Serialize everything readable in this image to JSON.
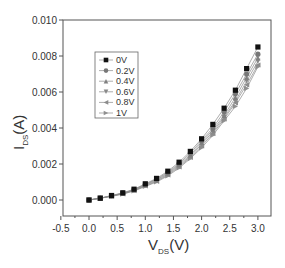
{
  "chart_data": {
    "type": "line",
    "title": "",
    "xlabel": "V_DS (V)",
    "ylabel": "I_DS (A)",
    "xlabel_main": "V",
    "xlabel_sub": "DS",
    "xlabel_unit": "(V)",
    "ylabel_main": "I",
    "ylabel_sub": "DS",
    "ylabel_unit": "(A)",
    "xlim": [
      -0.5,
      3.25
    ],
    "ylim": [
      -0.0009,
      0.01
    ],
    "x_ticks": [
      "-0.5",
      "0.0",
      "0.5",
      "1.0",
      "1.5",
      "2.0",
      "2.5",
      "3.0"
    ],
    "x_tick_values": [
      -0.5,
      0.0,
      0.5,
      1.0,
      1.5,
      2.0,
      2.5,
      3.0
    ],
    "y_ticks": [
      "0.000",
      "0.002",
      "0.004",
      "0.006",
      "0.008",
      "0.010"
    ],
    "y_tick_values": [
      0.0,
      0.002,
      0.004,
      0.006,
      0.008,
      0.01
    ],
    "grid": false,
    "legend_position": "upper-left-inside",
    "x": [
      0.0,
      0.2,
      0.4,
      0.6,
      0.8,
      1.0,
      1.2,
      1.4,
      1.6,
      1.8,
      2.0,
      2.2,
      2.4,
      2.6,
      2.8,
      3.0
    ],
    "series": [
      {
        "name": "0V",
        "marker": "square",
        "color": "#111111",
        "values": [
          0.0,
          0.0001,
          0.00025,
          0.0004,
          0.0006,
          0.0009,
          0.0012,
          0.0016,
          0.0021,
          0.0027,
          0.0034,
          0.0042,
          0.0051,
          0.0061,
          0.0073,
          0.0085
        ]
      },
      {
        "name": "0.2V",
        "marker": "circle",
        "color": "#777777",
        "values": [
          0.0,
          0.0001,
          0.00024,
          0.00038,
          0.00058,
          0.00087,
          0.00116,
          0.00154,
          0.00202,
          0.0026,
          0.0033,
          0.004,
          0.0049,
          0.0059,
          0.007,
          0.0081
        ]
      },
      {
        "name": "0.4V",
        "marker": "triangle-up",
        "color": "#808080",
        "values": [
          0.0,
          0.0001,
          0.00023,
          0.00037,
          0.00056,
          0.00084,
          0.00112,
          0.00149,
          0.00196,
          0.0025,
          0.0032,
          0.0039,
          0.0047,
          0.0057,
          0.0068,
          0.0079
        ]
      },
      {
        "name": "0.6V",
        "marker": "triangle-down",
        "color": "#888888",
        "values": [
          0.0,
          0.0001,
          0.00022,
          0.00036,
          0.00054,
          0.00081,
          0.00108,
          0.00144,
          0.0019,
          0.00243,
          0.0031,
          0.0038,
          0.0046,
          0.0055,
          0.0066,
          0.0077
        ]
      },
      {
        "name": "0.8V",
        "marker": "triangle-left",
        "color": "#8c8c8c",
        "values": [
          0.0,
          0.0001,
          0.00021,
          0.00034,
          0.00052,
          0.00078,
          0.00104,
          0.00139,
          0.00184,
          0.00236,
          0.003,
          0.0037,
          0.0045,
          0.0054,
          0.0064,
          0.0075
        ]
      },
      {
        "name": "1V",
        "marker": "triangle-right",
        "color": "#909090",
        "values": [
          0.0,
          0.0001,
          0.0002,
          0.00033,
          0.0005,
          0.00075,
          0.001,
          0.00134,
          0.00178,
          0.0023,
          0.0029,
          0.0036,
          0.0044,
          0.0052,
          0.0062,
          0.0074
        ]
      }
    ]
  }
}
